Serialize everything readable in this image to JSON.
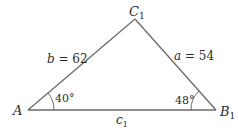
{
  "diagram": {
    "type": "triangle",
    "vertices": {
      "A": {
        "label": "A",
        "x": 28,
        "y": 110
      },
      "B1": {
        "label": "B",
        "subscript": "1",
        "x": 216,
        "y": 110
      },
      "C1": {
        "label": "C",
        "subscript": "1",
        "x": 135,
        "y": 19
      }
    },
    "sides": {
      "b": {
        "var": "b",
        "text": " = 62",
        "value": 62
      },
      "a": {
        "var": "a",
        "text": " = 54",
        "value": 54
      },
      "c1": {
        "var": "c",
        "subscript": "1"
      }
    },
    "angles": {
      "A": {
        "text": "40°",
        "value": 40
      },
      "B1": {
        "text": "48°",
        "value": 48
      }
    },
    "colors": {
      "line": "#6a6a6a",
      "text": "#2a2a2a"
    }
  }
}
